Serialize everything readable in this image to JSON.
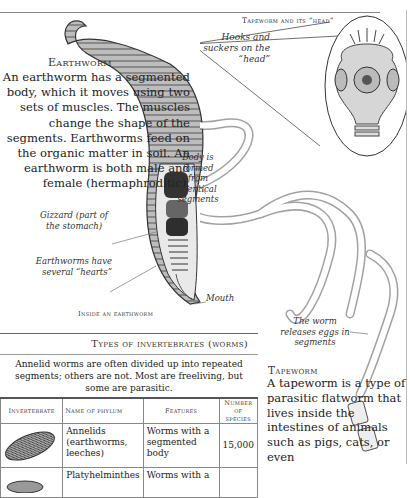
{
  "earthworm": {
    "title": "Earthworm",
    "body": "An earthworm has a segmented body, which it moves using two sets of muscles. The muscles change the shape of the segments. Earthworms feed on the organic matter in soil. An earthworm is both male and female (hermaphroditic).",
    "labels": {
      "body_formed": "Body is formed from identical segments",
      "gizzard": "Gizzard (part of the stomach)",
      "hearts": "Earthworms have several “hearts”",
      "mouth": "Mouth"
    },
    "caption": "Inside an earthworm"
  },
  "tapeworm": {
    "head_title": "Tapeworm and its “head”",
    "hooks_label": "Hooks and suckers on the “head”",
    "eggs_label": "The worm releases eggs in segments",
    "title": "Tapeworm",
    "body": "A tapeworm is a type of parasitic flatworm that lives inside the intestines of animals such as pigs, cats, or even"
  },
  "table": {
    "title": "Types of invertebrates (worms)",
    "intro": "Annelid worms are often divided up into repeated segments; others are not. Most are freeliving, but some are parasitic.",
    "headers": [
      "Invertebrate",
      "Name of phylum",
      "Features",
      "Number of species"
    ],
    "rows": [
      {
        "image": "annelid-illustration",
        "phylum": "Annelids (earthworms, leeches)",
        "features": "Worms with a segmented body",
        "species": "15,000"
      },
      {
        "image": "flatworm-illustration",
        "phylum": "Platyhelminthes",
        "features": "Worms with a",
        "species": ""
      }
    ]
  }
}
